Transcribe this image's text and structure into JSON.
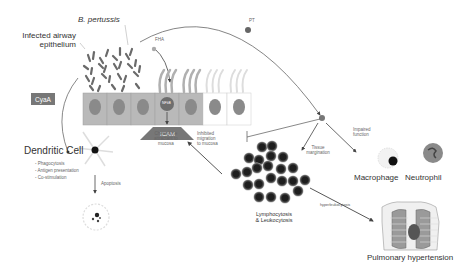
{
  "labels": {
    "infected_epithelium": "Infected airway epithelium",
    "infected_line1": "Infected airway",
    "infected_line2": "epithelium",
    "b_pertussis": "B. pertussis",
    "fha": "FHA",
    "pt": "PT",
    "cyaa": "CyaA",
    "nfkb": "NFkB",
    "icam": "ICAM",
    "dendritic_cell": "Dendritic Cell",
    "dc_functions": [
      "Phagocytosis",
      "Antigen presentation",
      "Co-stimulation"
    ],
    "apoptosis": "Apoptosis",
    "chemokine_1": "Chemokine",
    "chemokine_2": "attractant to",
    "chemokine_3": "mucosa",
    "inhibited_1": "Inhibited",
    "inhibited_2": "migration",
    "inhibited_3": "to mucosa",
    "tissue_1": "Tissue",
    "tissue_2": "margination",
    "impaired_1": "Impaired",
    "impaired_2": "function",
    "macrophage": "Macrophage",
    "neutrophil": "Neutrophil",
    "lympho_1": "Lymphocytosis",
    "lympho_2": "& Leukocytosis",
    "hyperleukocytosis": "hyperleukocytosis",
    "pulmonary_hypertension": "Pulmonary hypertension"
  },
  "colors": {
    "cell_gray": "#b9b9b9",
    "nucleus": "#8a8a8a",
    "bacteria": "#6a6a6a",
    "line": "#555555",
    "icam": "#777777"
  }
}
